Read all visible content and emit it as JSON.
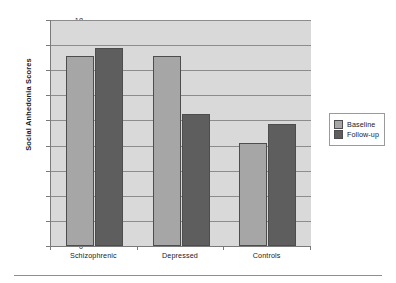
{
  "chart_data": {
    "type": "bar",
    "title": "",
    "subtitle": "",
    "xlabel": "",
    "ylabel": "Social Anhedonia Scores",
    "categories": [
      "Schizophrenic",
      "Depressed",
      "Controls"
    ],
    "series": [
      {
        "name": "Baseline",
        "color": "#a6a6a6",
        "values": [
          15.1,
          15.1,
          8.2
        ]
      },
      {
        "name": "Follow-up",
        "color": "#5e5e5e",
        "values": [
          15.8,
          10.5,
          9.7
        ]
      }
    ],
    "ylim": [
      0,
      18
    ],
    "ytick_step": 2,
    "yticks": [
      0,
      2,
      4,
      6,
      8,
      10,
      12,
      14,
      16,
      18
    ],
    "ytick_labels": [
      "0",
      "2",
      "4",
      "6",
      "8",
      "10",
      "12",
      "14",
      "16",
      "18"
    ],
    "grid": "horizontal",
    "legend_position": "right",
    "plot_background": "#d9d9d9"
  },
  "legend": {
    "entries": [
      {
        "label": "Baseline"
      },
      {
        "label": "Follow-up"
      }
    ]
  }
}
